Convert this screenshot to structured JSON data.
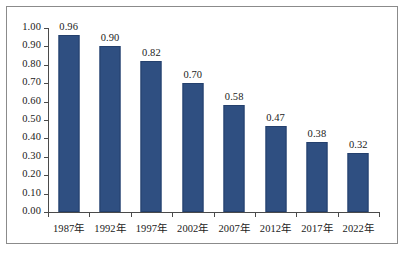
{
  "chart_data": {
    "type": "bar",
    "title": "",
    "subtitle": "",
    "xlabel": "",
    "ylabel": "",
    "categories": [
      "1987年",
      "1992年",
      "1997年",
      "2002年",
      "2007年",
      "2012年",
      "2017年",
      "2022年"
    ],
    "values": [
      0.96,
      0.9,
      0.82,
      0.7,
      0.58,
      0.47,
      0.38,
      0.32
    ],
    "data_labels": [
      "0.96",
      "0.90",
      "0.82",
      "0.70",
      "0.58",
      "0.47",
      "0.38",
      "0.32"
    ],
    "ylim": [
      0.0,
      1.0
    ],
    "ytick_values": [
      1.0,
      0.9,
      0.8,
      0.7,
      0.6,
      0.5,
      0.4,
      0.3,
      0.2,
      0.1,
      0.0
    ],
    "ytick_labels": [
      "1.00",
      "0.90",
      "0.80",
      "0.70",
      "0.60",
      "0.50",
      "0.40",
      "0.30",
      "0.20",
      "0.10",
      "0.00"
    ],
    "grid": false,
    "legend": null,
    "legend_position": "none",
    "series": [
      {
        "name": "",
        "values": [
          0.96,
          0.9,
          0.82,
          0.7,
          0.58,
          0.47,
          0.38,
          0.32
        ],
        "color": "#2f4f81"
      }
    ],
    "annotations": []
  },
  "colors": {
    "bar_fill": "#2f4f81",
    "bar_stroke": "#24406d",
    "axis_line": "#4a4a4a",
    "frame_border": "#8b8b8b",
    "text": "#1a1a1a",
    "background": "#ffffff"
  }
}
